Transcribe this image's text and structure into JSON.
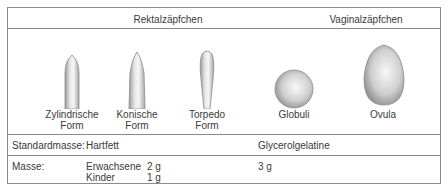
{
  "header": {
    "rectal": "Rektalzäpfchen",
    "vaginal": "Vaginalzäpfchen"
  },
  "shapes": [
    {
      "name": "zylindrische-form",
      "line1": "Zylindrische",
      "line2": "Form"
    },
    {
      "name": "konische-form",
      "line1": "Konische",
      "line2": "Form"
    },
    {
      "name": "torpedo-form",
      "line1": "Torpedo",
      "line2": "Form"
    },
    {
      "name": "globuli",
      "line1": "Globuli",
      "line2": ""
    },
    {
      "name": "ovula",
      "line1": "Ovula",
      "line2": ""
    }
  ],
  "rows": {
    "standardmasse": {
      "label": "Standardmasse:",
      "rectal": "Hartfett",
      "vaginal": "Glycerolgelatine"
    },
    "masse": {
      "label": "Masse:",
      "rectal": [
        {
          "group": "Erwachsene",
          "value": "2 g"
        },
        {
          "group": "Kinder",
          "value": "1 g"
        }
      ],
      "vaginal": "3 g"
    }
  },
  "colors": {
    "border": "#8a8a8a",
    "text": "#3a3a3a",
    "shape_light": "#f4f4f4",
    "shape_dark": "#9a9a9a"
  }
}
